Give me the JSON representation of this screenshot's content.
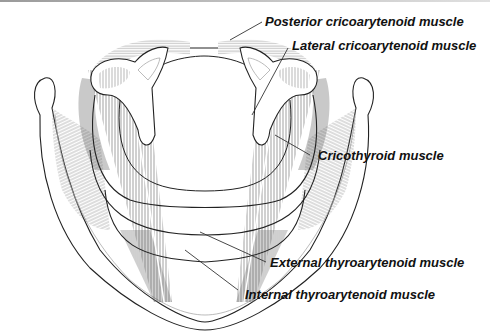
{
  "figure": {
    "labels": [
      {
        "id": "posterior-cricoarytenoid",
        "text": "Posterior cricoarytenoid muscle"
      },
      {
        "id": "lateral-cricoarytenoid",
        "text": "Lateral cricoarytenoid muscle"
      },
      {
        "id": "cricothyroid",
        "text": "Cricothyroid muscle"
      },
      {
        "id": "external-thyroarytenoid",
        "text": "External thyroarytenoid muscle"
      },
      {
        "id": "internal-thyroarytenoid",
        "text": "Internal thyroarytenoid muscle"
      }
    ]
  },
  "colors": {
    "outline": "#222222",
    "hatch": "#7a7a7a",
    "label": "#111111",
    "background": "#ffffff"
  }
}
